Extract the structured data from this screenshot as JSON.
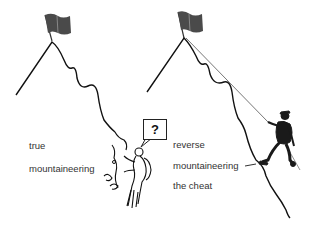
{
  "left_panel": {
    "label_line1": "true",
    "label_line2": "mountaineering",
    "speech_bubble": "?"
  },
  "right_panel": {
    "label_line1": "reverse",
    "label_line2": "mountaineering",
    "label_line3": "the cheat"
  },
  "colors": {
    "line": "#111111",
    "text": "#333333",
    "flag": "#444444",
    "rope": "#777777"
  }
}
